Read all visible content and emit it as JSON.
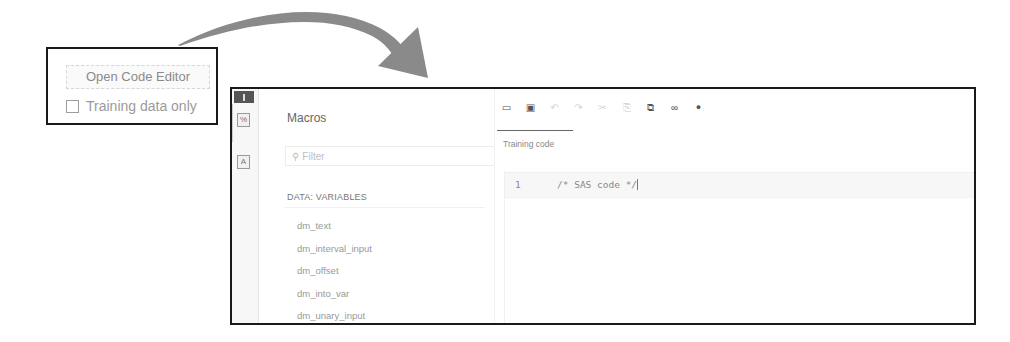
{
  "callout": {
    "open_code_editor_label": "Open Code Editor",
    "training_checkbox_label": "Training data only",
    "training_checked": false
  },
  "editor": {
    "macros_panel": {
      "title": "Macros",
      "filter_placeholder": "Filter",
      "section_header": "DATA: VARIABLES",
      "variables": [
        "dm_text",
        "dm_interval_input",
        "dm_offset",
        "dm_into_var",
        "dm_unary_input"
      ],
      "collapse_icon": "«"
    },
    "toolbar": {
      "icons": [
        {
          "name": "open-folder-icon",
          "glyph": "🗀",
          "enabled": true
        },
        {
          "name": "save-icon",
          "glyph": "🖫",
          "enabled": true
        },
        {
          "name": "undo-icon",
          "glyph": "↶",
          "enabled": false
        },
        {
          "name": "redo-icon",
          "glyph": "↷",
          "enabled": false
        },
        {
          "name": "cut-icon",
          "glyph": "✂",
          "enabled": false
        },
        {
          "name": "copy-icon",
          "glyph": "⎘",
          "enabled": false
        },
        {
          "name": "paste-icon",
          "glyph": "📋",
          "enabled": true
        },
        {
          "name": "find-icon",
          "glyph": "👓",
          "enabled": true
        },
        {
          "name": "run-icon",
          "glyph": "●",
          "enabled": true
        }
      ]
    },
    "tab": {
      "label": "Training code"
    },
    "code": {
      "line_number": "1",
      "text": "/* SAS code */"
    }
  },
  "colors": {
    "border": "#1a1a1a",
    "arrow": "#8a8a8a"
  }
}
